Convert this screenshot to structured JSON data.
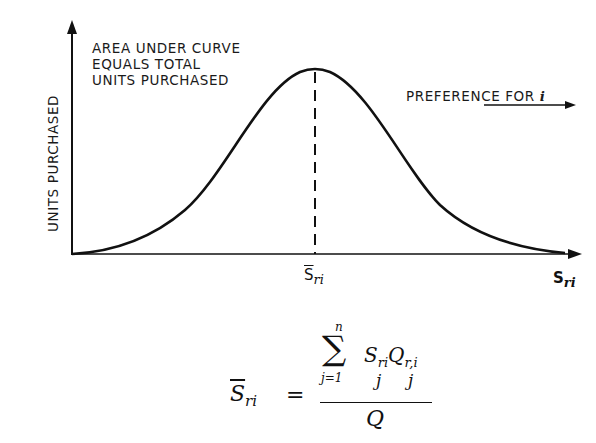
{
  "figure": {
    "top_fragment": "— — — —",
    "y_axis_label": "UNITS PURCHASED",
    "annotation_lines": [
      "AREA UNDER CURVE",
      "EQUALS TOTAL",
      "UNITS PURCHASED"
    ],
    "preference_label": "PREFERENCE FOR",
    "preference_var": "i",
    "mean_tick_label": {
      "base": "S",
      "sub": "ri"
    },
    "x_axis_label": {
      "base": "S",
      "sub": "ri"
    },
    "curve": {
      "type": "bell",
      "peak_x_px": 315,
      "peak_y_px": 69,
      "baseline_y_px": 254,
      "x_start_px": 72,
      "x_end_px": 580
    },
    "colors": {
      "ink": "#111111",
      "background": "#ffffff"
    }
  },
  "formula": {
    "lhs": {
      "base": "S",
      "sub": "ri",
      "overline": true
    },
    "equals": "=",
    "sum_upper": "n",
    "sum_lower": "j=1",
    "sum_symbol": "∑",
    "numerator_terms": "S",
    "numerator_sub1": "ri",
    "numerator_q": "Q",
    "numerator_sub2": "r,i",
    "under_j1": "j",
    "under_j2": "j",
    "denominator": "Q"
  }
}
